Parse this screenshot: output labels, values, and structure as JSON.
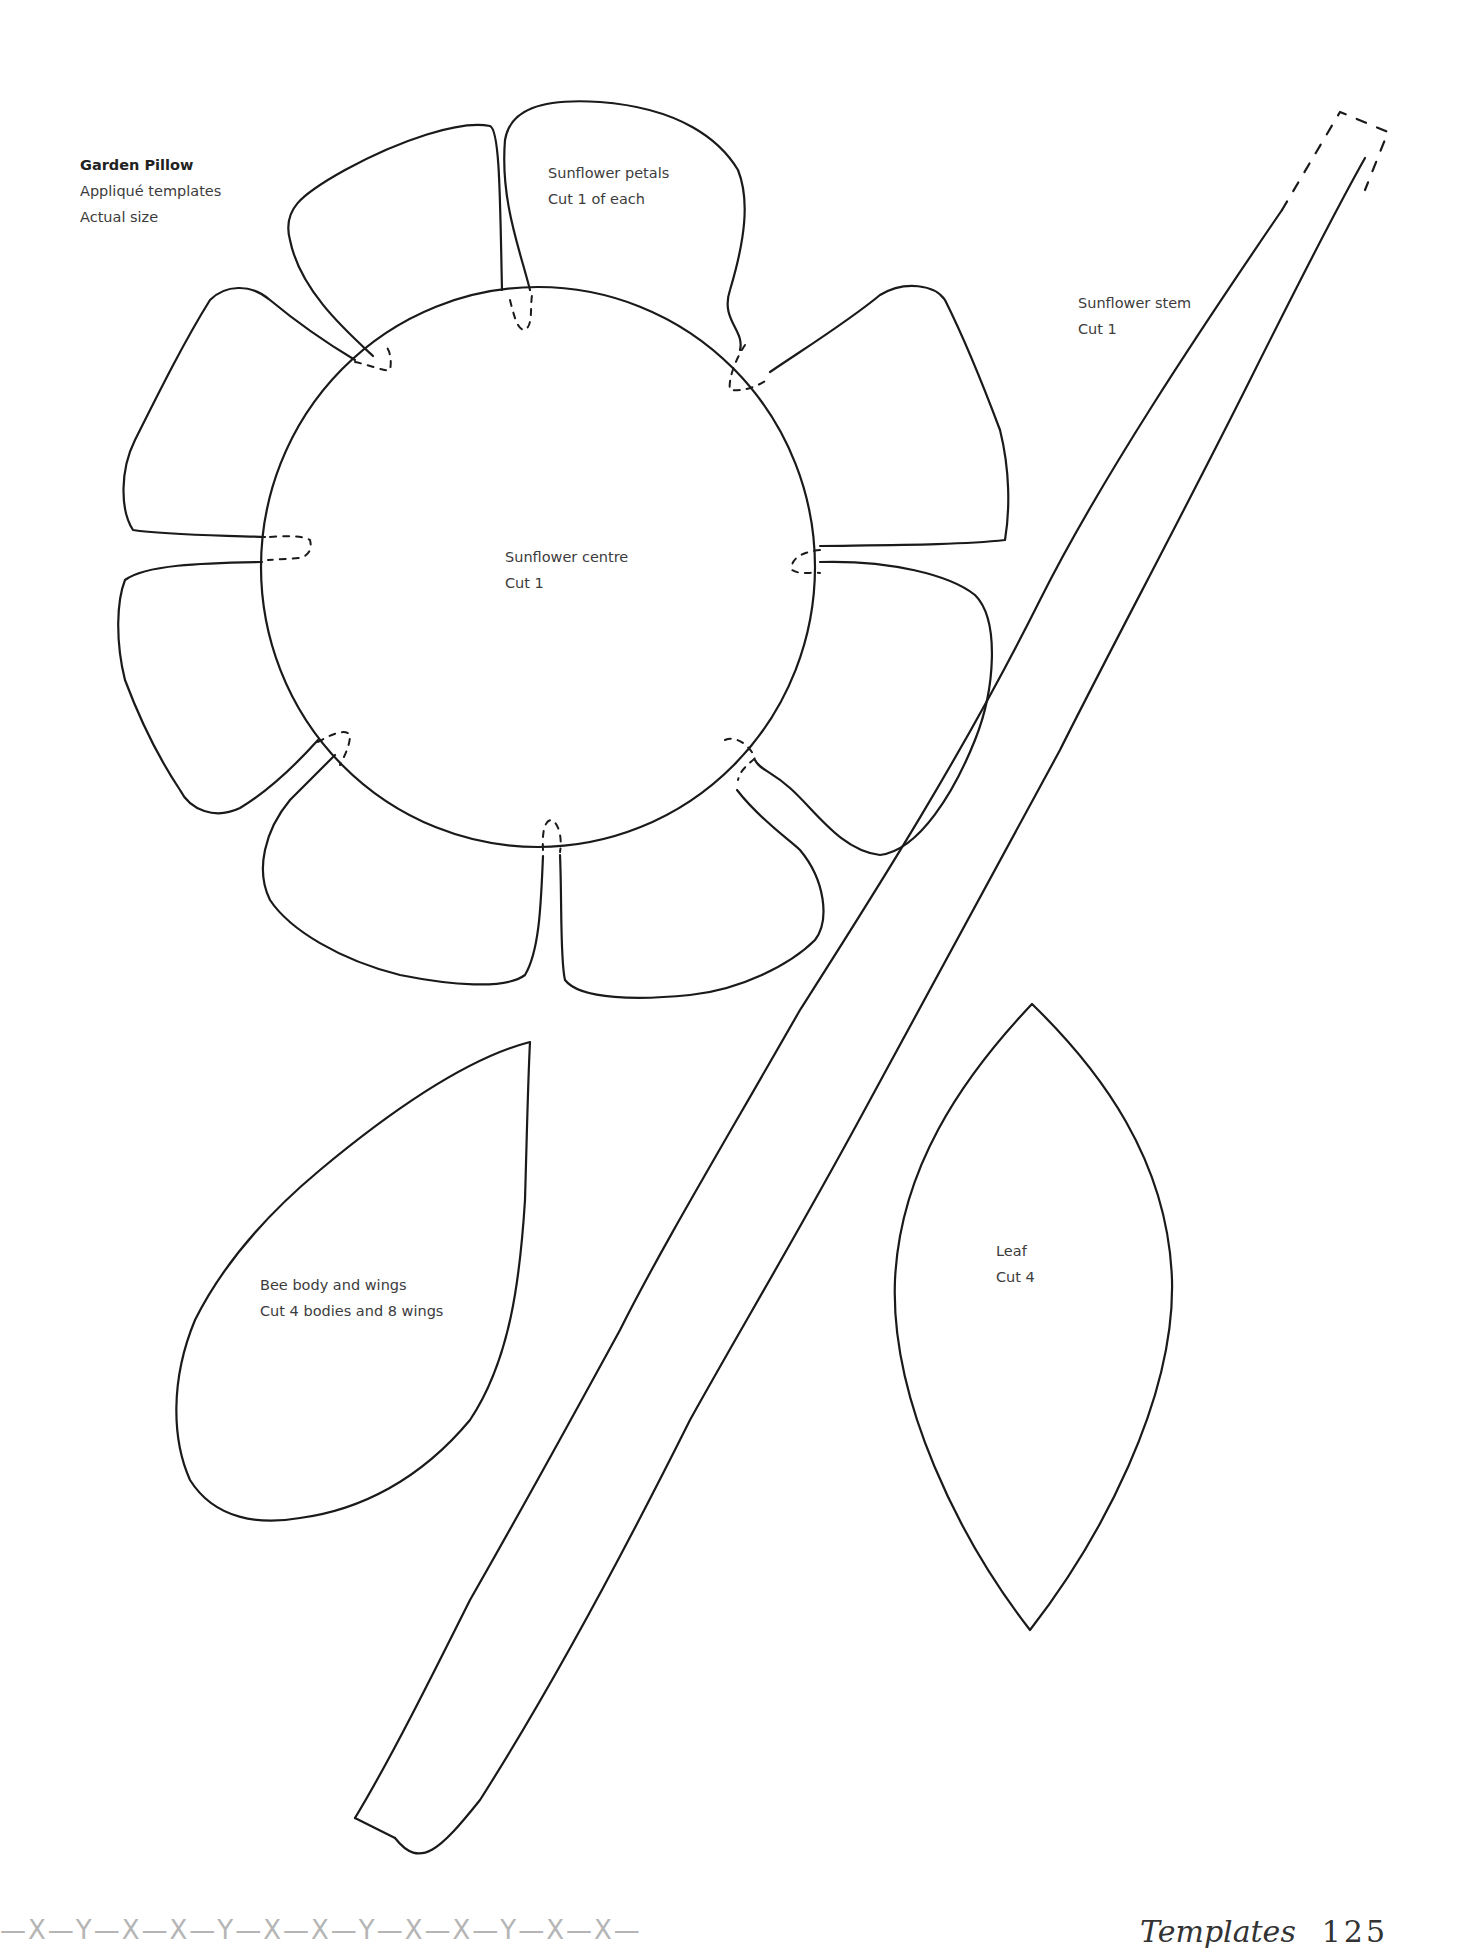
{
  "header": {
    "title": "Garden Pillow",
    "subtitle": "Appliqué templates",
    "scale_note": "Actual size"
  },
  "templates": {
    "petals": {
      "name": "Sunflower petals",
      "instruction": "Cut 1 of each",
      "count_shapes": 8
    },
    "centre": {
      "name": "Sunflower centre",
      "instruction": "Cut 1"
    },
    "stem": {
      "name": "Sunflower stem",
      "instruction": "Cut 1"
    },
    "bee": {
      "name": "Bee body and wings",
      "instruction": "Cut 4 bodies and 8 wings"
    },
    "leaf": {
      "name": "Leaf",
      "instruction": "Cut 4"
    }
  },
  "footer": {
    "pattern": "—X—Y—X—X—Y—X—X—Y—X—X—Y—X—X—",
    "section": "Templates",
    "page_number": "125"
  },
  "colors": {
    "line": "#1a1a1a",
    "text": "#3c3c3c",
    "footer_pattern": "#b5b5b5"
  }
}
